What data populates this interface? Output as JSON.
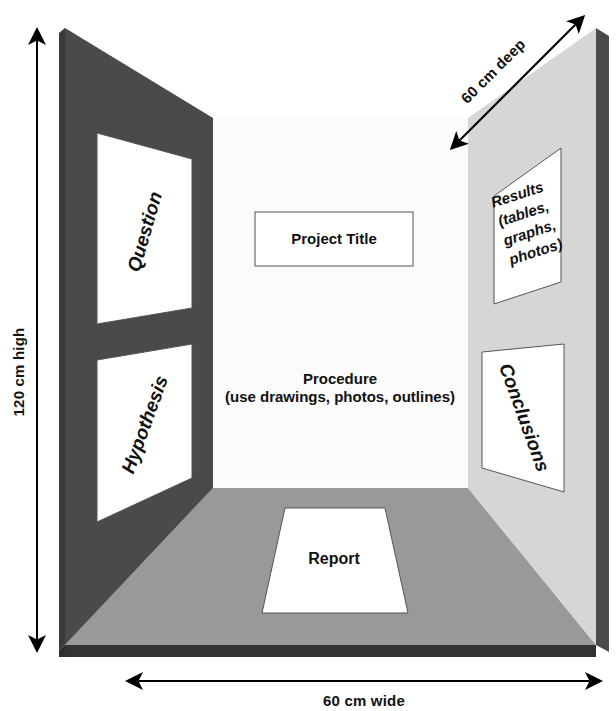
{
  "diagram": {
    "colors": {
      "left_wall": "#4a4a4a",
      "left_wall_edge": "#3a3a3a",
      "right_wall": "#d6d6d6",
      "right_wall_edge": "#4a4a4a",
      "back_wall": "#fbfbfb",
      "floor": "#999999",
      "floor_front_edge": "#333333",
      "card_fill": "#ffffff",
      "card_stroke": "#555555",
      "text": "#111111",
      "arrow": "#000000"
    }
  },
  "dimensions": {
    "height_label": "120 cm high",
    "width_label": "60 cm wide",
    "depth_label": "60 cm deep"
  },
  "panels": {
    "question": {
      "label": "Question"
    },
    "hypothesis": {
      "label": "Hypothesis"
    },
    "project_title": {
      "label": "Project Title"
    },
    "procedure": {
      "line1": "Procedure",
      "line2": "(use drawings, photos, outlines)"
    },
    "results": {
      "line1": "Results",
      "line2": "(tables,",
      "line3": "graphs,",
      "line4": "photos)"
    },
    "conclusions": {
      "label": "Conclusions"
    },
    "report": {
      "label": "Report"
    }
  }
}
